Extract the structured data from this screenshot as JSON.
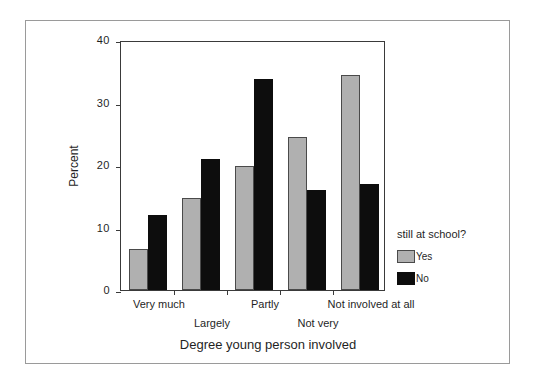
{
  "chart_data": {
    "type": "bar",
    "title": "",
    "xlabel": "Degree young person involved",
    "ylabel": "Percent",
    "categories": [
      "Very much",
      "Largely",
      "Partly",
      "Not very",
      "Not involved at all"
    ],
    "series": [
      {
        "name": "Yes",
        "color": "#b0b0b0",
        "values": [
          6.5,
          14.8,
          19.8,
          24.5,
          34.4
        ]
      },
      {
        "name": "No",
        "color": "#0d0d0d",
        "values": [
          12.0,
          21.0,
          33.8,
          16.0,
          17.0
        ]
      }
    ],
    "ylim": [
      0,
      40
    ],
    "yticks": [
      0,
      10,
      20,
      30,
      40
    ],
    "ytick_labels": [
      "0",
      "10",
      "20",
      "30",
      "40"
    ],
    "grid": false,
    "legend_position": "right",
    "legend_title": "still at school?"
  },
  "axes": {
    "y_title": "Percent",
    "x_title": "Degree young person involved",
    "y_tick_labels": [
      "40",
      "30",
      "20",
      "10",
      "0"
    ]
  },
  "categories": {
    "c0": "Very much",
    "c1": "Largely",
    "c2": "Partly",
    "c3": "Not very",
    "c4": "Not involved at all"
  },
  "legend": {
    "title": "still at school?",
    "yes_label": "Yes",
    "no_label": "No"
  }
}
